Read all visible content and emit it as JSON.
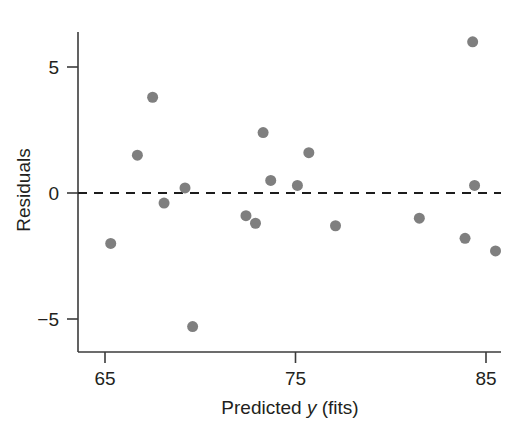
{
  "chart_data": {
    "type": "scatter",
    "title": "",
    "xlabel": "Predicted y (fits)",
    "xlabel_parts": {
      "lead": "Predicted ",
      "italic": "y",
      "trail": " (fits)"
    },
    "ylabel": "Residuals",
    "xlim": [
      63.5,
      86.5
    ],
    "ylim": [
      -6.6,
      7.3
    ],
    "xticks": [
      65,
      75,
      85
    ],
    "xticklabels": [
      "65",
      "75",
      "85"
    ],
    "yticks": [
      -5,
      0,
      5
    ],
    "yticklabels": [
      "−5",
      "0",
      "5"
    ],
    "grid": false,
    "legend": null,
    "reference_line": {
      "y": 0,
      "style": "dashed",
      "color": "#1c1c1c"
    },
    "marker": {
      "shape": "circle",
      "color": "#7f7f7f",
      "size_px": 11
    },
    "points": [
      {
        "x": 65.3,
        "y": -2.0
      },
      {
        "x": 66.7,
        "y": 1.5
      },
      {
        "x": 67.5,
        "y": 3.8
      },
      {
        "x": 68.1,
        "y": -0.4
      },
      {
        "x": 69.2,
        "y": 0.2
      },
      {
        "x": 69.6,
        "y": -5.3
      },
      {
        "x": 72.4,
        "y": -0.9
      },
      {
        "x": 72.9,
        "y": -1.2
      },
      {
        "x": 73.3,
        "y": 2.4
      },
      {
        "x": 73.7,
        "y": 0.5
      },
      {
        "x": 75.1,
        "y": 0.3
      },
      {
        "x": 75.7,
        "y": 1.6
      },
      {
        "x": 77.1,
        "y": -1.3
      },
      {
        "x": 81.5,
        "y": -1.0
      },
      {
        "x": 83.9,
        "y": -1.8
      },
      {
        "x": 84.3,
        "y": 6.0
      },
      {
        "x": 84.4,
        "y": 0.3
      },
      {
        "x": 85.5,
        "y": -2.3
      }
    ]
  },
  "axes": {
    "x_axis_name": "x-axis",
    "y_axis_name": "y-axis"
  }
}
